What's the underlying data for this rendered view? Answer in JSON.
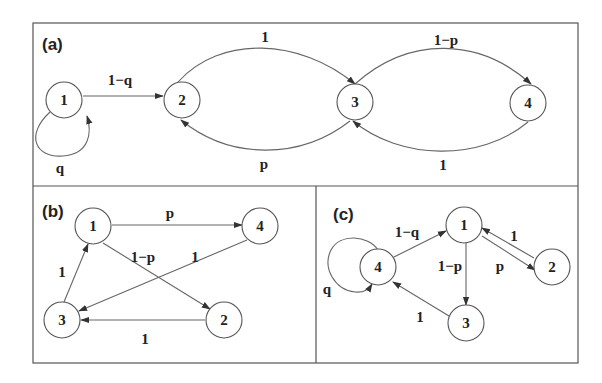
{
  "figure": {
    "panels": [
      {
        "id": "a",
        "label": "(a)",
        "nodes": [
          {
            "id": "1",
            "label": "1",
            "x": 64,
            "y": 100
          },
          {
            "id": "2",
            "label": "2",
            "x": 182,
            "y": 100
          },
          {
            "id": "3",
            "label": "3",
            "x": 355,
            "y": 102
          },
          {
            "id": "4",
            "label": "4",
            "x": 528,
            "y": 103
          }
        ],
        "edges": [
          {
            "from": "1",
            "to": "1",
            "label": "q"
          },
          {
            "from": "1",
            "to": "2",
            "label": "1−q"
          },
          {
            "from": "2",
            "to": "3",
            "label": "1"
          },
          {
            "from": "3",
            "to": "2",
            "label": "p"
          },
          {
            "from": "3",
            "to": "4",
            "label": "1−p"
          },
          {
            "from": "4",
            "to": "3",
            "label": "1"
          }
        ]
      },
      {
        "id": "b",
        "label": "(b)",
        "nodes": [
          {
            "id": "1",
            "label": "1",
            "x": 93,
            "y": 226
          },
          {
            "id": "2",
            "label": "2",
            "x": 224,
            "y": 320
          },
          {
            "id": "3",
            "label": "3",
            "x": 62,
            "y": 320
          },
          {
            "id": "4",
            "label": "4",
            "x": 260,
            "y": 226
          }
        ],
        "edges": [
          {
            "from": "1",
            "to": "4",
            "label": "p"
          },
          {
            "from": "1",
            "to": "2",
            "label": "1−p"
          },
          {
            "from": "4",
            "to": "3",
            "label": "1"
          },
          {
            "from": "2",
            "to": "3",
            "label": "1"
          },
          {
            "from": "3",
            "to": "1",
            "label": "1"
          }
        ]
      },
      {
        "id": "c",
        "label": "(c)",
        "nodes": [
          {
            "id": "1",
            "label": "1",
            "x": 464,
            "y": 225
          },
          {
            "id": "2",
            "label": "2",
            "x": 552,
            "y": 267
          },
          {
            "id": "3",
            "label": "3",
            "x": 466,
            "y": 323
          },
          {
            "id": "4",
            "label": "4",
            "x": 378,
            "y": 267
          }
        ],
        "edges": [
          {
            "from": "4",
            "to": "4",
            "label": "q"
          },
          {
            "from": "4",
            "to": "1",
            "label": "1−q"
          },
          {
            "from": "1",
            "to": "3",
            "label": "1−p"
          },
          {
            "from": "1",
            "to": "2",
            "label": "p"
          },
          {
            "from": "2",
            "to": "1",
            "label": "1"
          },
          {
            "from": "3",
            "to": "4",
            "label": "1"
          }
        ]
      }
    ]
  }
}
